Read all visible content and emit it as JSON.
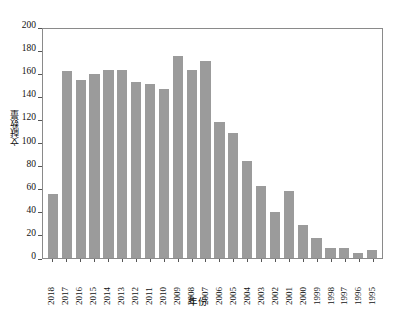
{
  "chart_data": {
    "type": "bar",
    "title": "",
    "xlabel": "年份",
    "ylabel": "文献数量",
    "ylim": [
      0,
      200
    ],
    "yticks": [
      200,
      180,
      160,
      140,
      120,
      100,
      80,
      60,
      40,
      20,
      0
    ],
    "grid": false,
    "legend": null,
    "bar_color": "#9b9b9b",
    "categories": [
      "2018",
      "2017",
      "2016",
      "2015",
      "2014",
      "2013",
      "2012",
      "2011",
      "2010",
      "2009",
      "2008",
      "2007",
      "2006",
      "2005",
      "2004",
      "2003",
      "2002",
      "2001",
      "2000",
      "1999",
      "1998",
      "1997",
      "1996",
      "1995"
    ],
    "values": [
      55,
      162,
      154,
      159,
      163,
      163,
      152,
      151,
      146,
      175,
      163,
      171,
      118,
      108,
      84,
      62,
      40,
      58,
      29,
      17,
      9,
      9,
      4,
      7
    ]
  }
}
